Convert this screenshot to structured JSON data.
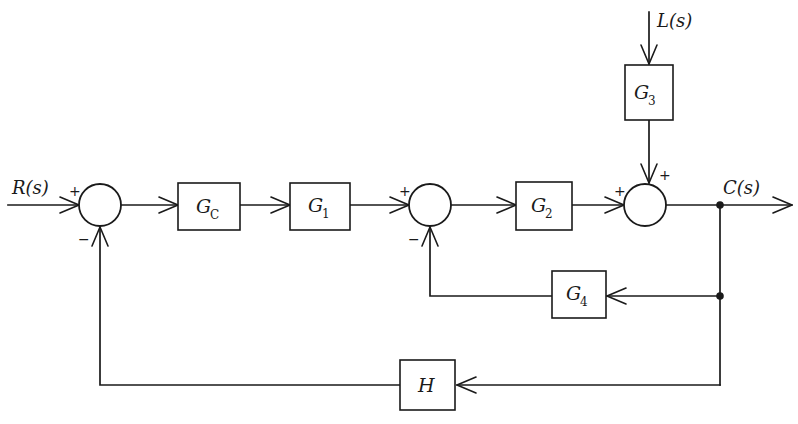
{
  "diagram": {
    "type": "block-diagram",
    "canvas": {
      "width": 798,
      "height": 424
    },
    "stroke_color": "#1a1a1a",
    "background_color": "#ffffff"
  },
  "signals": {
    "reference_input": "R(s)",
    "disturbance_input": "L(s)",
    "output": "C(s)"
  },
  "blocks": [
    {
      "id": "gc",
      "label": "G",
      "subscript": "C",
      "x": 178,
      "y": 183,
      "w": 62,
      "h": 47
    },
    {
      "id": "g1",
      "label": "G",
      "subscript": "1",
      "x": 290,
      "y": 183,
      "w": 60,
      "h": 47
    },
    {
      "id": "g2",
      "label": "G",
      "subscript": "2",
      "x": 516,
      "y": 182,
      "w": 56,
      "h": 48
    },
    {
      "id": "g3",
      "label": "G",
      "subscript": "3",
      "x": 625,
      "y": 65,
      "w": 48,
      "h": 55
    },
    {
      "id": "g4",
      "label": "G",
      "subscript": "4",
      "x": 552,
      "y": 271,
      "w": 54,
      "h": 47
    },
    {
      "id": "h",
      "label": "H",
      "subscript": "",
      "x": 400,
      "y": 360,
      "w": 55,
      "h": 50
    }
  ],
  "summing_junctions": [
    {
      "id": "sum1",
      "cx": 100,
      "cy": 205,
      "r": 21,
      "signs": [
        {
          "text": "+",
          "x": 69,
          "y": 190
        },
        {
          "text": "−",
          "x": 78,
          "y": 238
        }
      ]
    },
    {
      "id": "sum2",
      "cx": 430,
      "cy": 205,
      "r": 21,
      "signs": [
        {
          "text": "+",
          "x": 399,
          "y": 190
        },
        {
          "text": "−",
          "x": 408,
          "y": 238
        }
      ]
    },
    {
      "id": "sum3",
      "cx": 645,
      "cy": 205,
      "r": 21,
      "signs": [
        {
          "text": "+",
          "x": 614,
          "y": 190
        },
        {
          "text": "+",
          "x": 659,
          "y": 174
        }
      ]
    }
  ],
  "labels": {
    "r_of_s": {
      "text": "R(s)",
      "x": 12,
      "y": 194
    },
    "l_of_s": {
      "text": "L(s)",
      "x": 657,
      "y": 27
    },
    "c_of_s": {
      "text": "C(s)",
      "x": 723,
      "y": 194
    }
  },
  "branch_nodes": [
    {
      "id": "c-branch-top",
      "x": 720,
      "y": 205
    },
    {
      "id": "g4-branch",
      "x": 720,
      "y": 296
    }
  ],
  "paths": {
    "forward": "R(s) → sum1 → Gc → G1 → sum2 → G2 → sum3 → C(s)",
    "disturbance": "L(s) → G3 → sum3 (+)",
    "inner_feedback": "C(s) → G4 → sum2 (−)",
    "outer_feedback": "C(s) → H → sum1 (−)"
  }
}
